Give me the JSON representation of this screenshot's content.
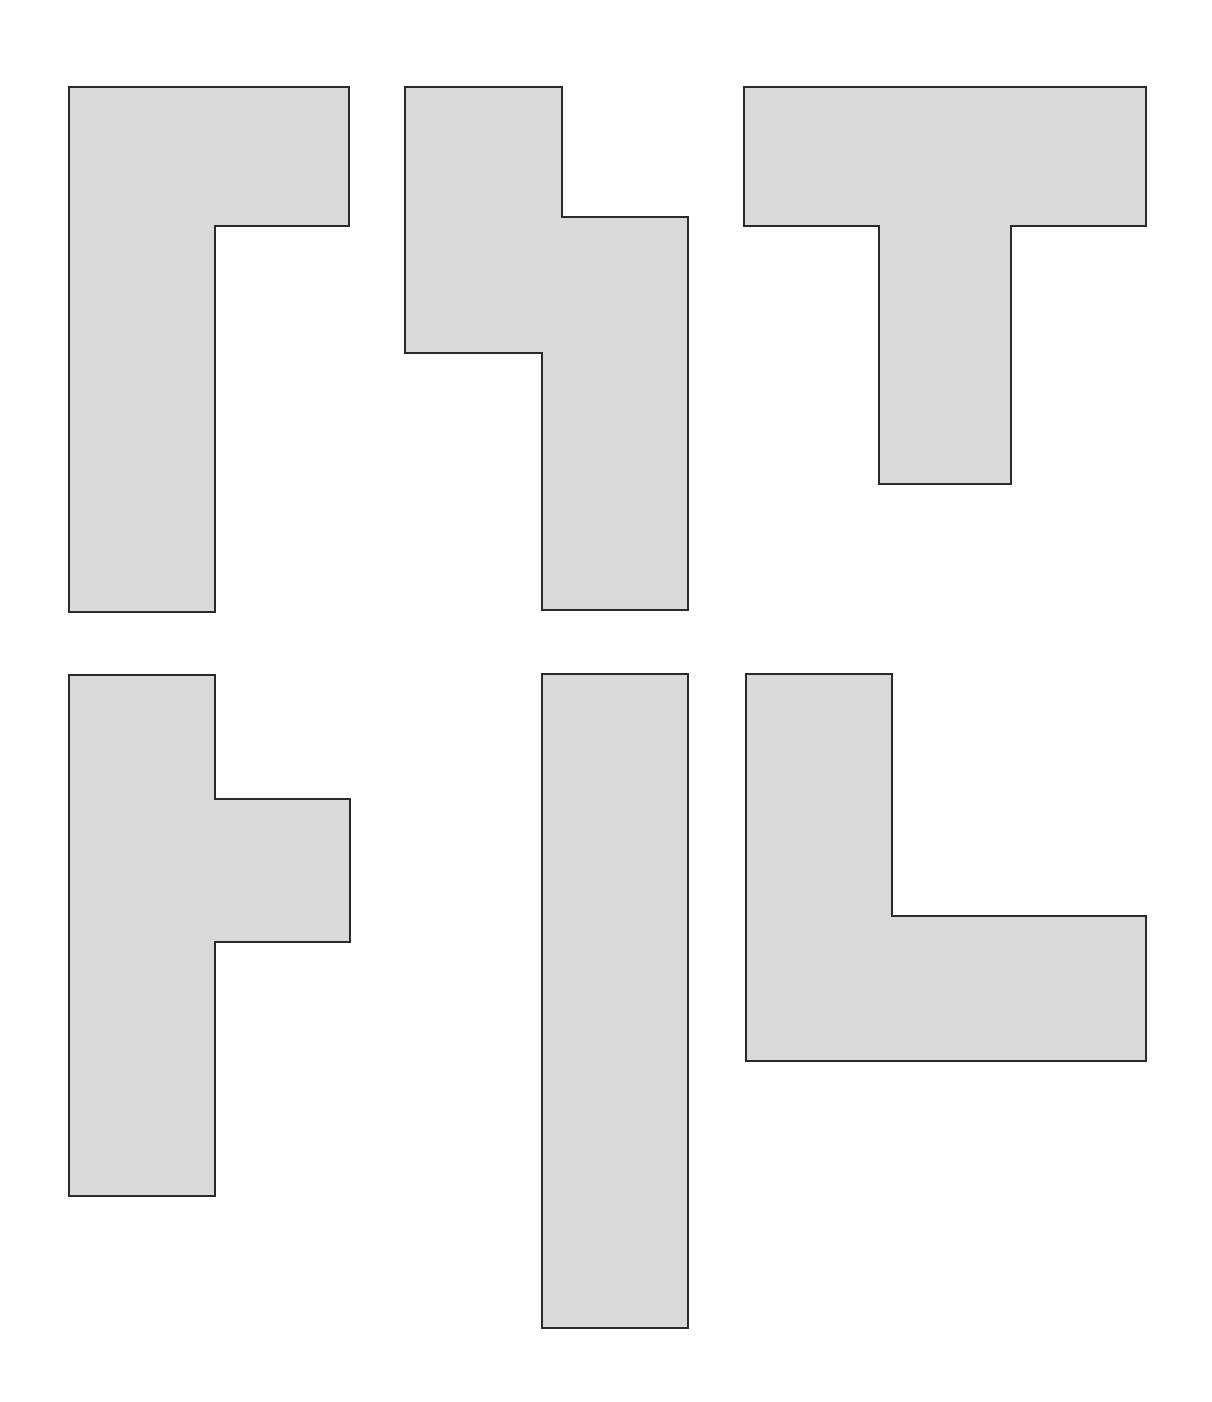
{
  "canvas": {
    "width": 1212,
    "height": 1402,
    "background": "#ffffff"
  },
  "style": {
    "fill": "#d9d9d9",
    "stroke": "#2a2a2a",
    "stroke_width": 2
  },
  "shapes": [
    {
      "name": "shape-gamma-top-left",
      "description": "Inverted L / Gamma-shaped polygon",
      "points": [
        [
          69,
          87
        ],
        [
          349,
          87
        ],
        [
          349,
          226
        ],
        [
          215,
          226
        ],
        [
          215,
          612
        ],
        [
          69,
          612
        ]
      ]
    },
    {
      "name": "shape-s-step-top-middle",
      "description": "Stepped S/Z-like polygon",
      "points": [
        [
          405,
          87
        ],
        [
          562,
          87
        ],
        [
          562,
          217
        ],
        [
          688,
          217
        ],
        [
          688,
          610
        ],
        [
          542,
          610
        ],
        [
          542,
          353
        ],
        [
          405,
          353
        ]
      ]
    },
    {
      "name": "shape-t-top-right",
      "description": "T-shaped polygon",
      "points": [
        [
          744,
          87
        ],
        [
          1146,
          87
        ],
        [
          1146,
          226
        ],
        [
          1011,
          226
        ],
        [
          1011,
          484
        ],
        [
          879,
          484
        ],
        [
          879,
          226
        ],
        [
          744,
          226
        ]
      ]
    },
    {
      "name": "shape-side-t-bottom-left",
      "description": "Sideways T polygon with right tab",
      "points": [
        [
          69,
          675
        ],
        [
          215,
          675
        ],
        [
          215,
          799
        ],
        [
          350,
          799
        ],
        [
          350,
          942
        ],
        [
          215,
          942
        ],
        [
          215,
          1196
        ],
        [
          69,
          1196
        ]
      ]
    },
    {
      "name": "shape-bar-bottom-middle",
      "description": "Tall vertical rectangle",
      "points": [
        [
          542,
          674
        ],
        [
          688,
          674
        ],
        [
          688,
          1328
        ],
        [
          542,
          1328
        ]
      ]
    },
    {
      "name": "shape-l-bottom-right",
      "description": "L-shaped polygon",
      "points": [
        [
          746,
          674
        ],
        [
          892,
          674
        ],
        [
          892,
          916
        ],
        [
          1146,
          916
        ],
        [
          1146,
          1061
        ],
        [
          746,
          1061
        ]
      ]
    }
  ]
}
